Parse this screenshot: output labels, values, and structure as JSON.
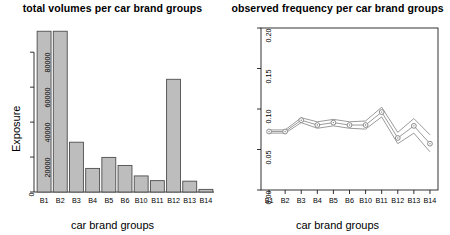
{
  "figure": {
    "background_color": "#ffffff",
    "axis_color": "#000000",
    "bar_fill_color": "#bdbdbd",
    "bar_stroke_color": "#4d4d4d",
    "line_color": "#808080",
    "marker_color": "#808080"
  },
  "panels": {
    "left": {
      "title": "total volumes per car brand groups",
      "xlabel": "car brand groups",
      "ylabel": "Exposure"
    },
    "right": {
      "title": "observed frequency per car brand groups",
      "xlabel": "car brand groups",
      "ylabel": "frequency"
    }
  },
  "chart_data": [
    {
      "type": "bar",
      "title": "total volumes per car brand groups",
      "xlabel": "car brand groups",
      "ylabel": "Exposure",
      "categories": [
        "B1",
        "B2",
        "B3",
        "B4",
        "B5",
        "B6",
        "B10",
        "B11",
        "B12",
        "B13",
        "B14"
      ],
      "values": [
        92000,
        92000,
        28500,
        13500,
        19800,
        15200,
        9200,
        6500,
        64500,
        6200,
        1500
      ],
      "ytick_labels": [
        "0",
        "20000",
        "40000",
        "60000",
        "80000"
      ],
      "ytick_values": [
        0,
        20000,
        40000,
        60000,
        80000
      ],
      "ylim": [
        0,
        95000
      ],
      "grid": false,
      "legend": "none"
    },
    {
      "type": "line",
      "title": "observed frequency per car brand groups",
      "xlabel": "car brand groups",
      "ylabel": "frequency",
      "categories": [
        "B1",
        "B2",
        "B3",
        "B4",
        "B5",
        "B6",
        "B10",
        "B11",
        "B12",
        "B13",
        "B14"
      ],
      "ytick_labels": [
        "0.00",
        "0.05",
        "0.10",
        "0.15",
        "0.20"
      ],
      "ytick_values": [
        0.0,
        0.05,
        0.1,
        0.15,
        0.2
      ],
      "ylim": [
        0.0,
        0.2
      ],
      "grid": false,
      "legend": "none",
      "series": [
        {
          "name": "observed frequency",
          "values": [
            0.0722,
            0.0722,
            0.0862,
            0.0802,
            0.0832,
            0.0802,
            0.0802,
            0.0962,
            0.0642,
            0.0792,
            0.0572
          ],
          "marker": "circle"
        },
        {
          "name": "upper confidence band",
          "values": [
            0.0742,
            0.0742,
            0.0892,
            0.0842,
            0.0872,
            0.0842,
            0.0852,
            0.1022,
            0.0712,
            0.0882,
            0.0682
          ],
          "marker": "none"
        },
        {
          "name": "lower confidence band",
          "values": [
            0.0702,
            0.0702,
            0.0832,
            0.0762,
            0.0792,
            0.0762,
            0.0752,
            0.0902,
            0.0572,
            0.0702,
            0.0472
          ],
          "marker": "none"
        }
      ]
    }
  ]
}
